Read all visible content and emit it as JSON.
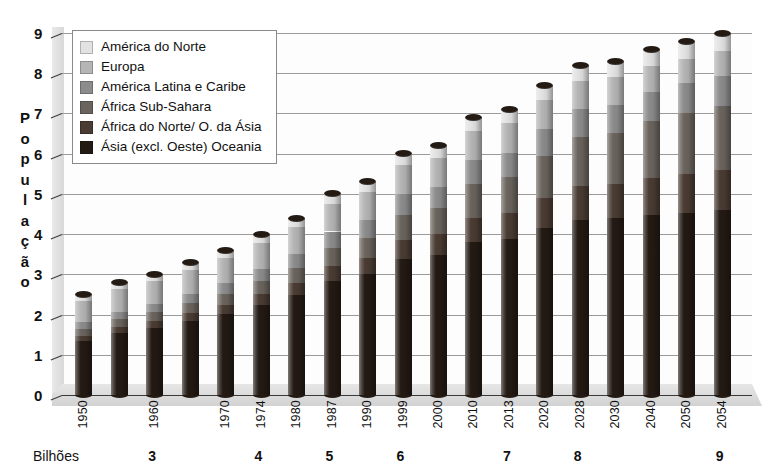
{
  "chart_data": {
    "type": "bar",
    "subtype": "stacked-3d-cylinder",
    "title": "",
    "xlabel": "",
    "ylabel": "População",
    "ylim": [
      0,
      9
    ],
    "yticks": [
      "0",
      "1",
      "2",
      "3",
      "4",
      "5",
      "6",
      "7",
      "8",
      "9"
    ],
    "grid": true,
    "legend_position": "top-left",
    "units_note": "Bilhões",
    "categories": [
      "1950",
      "",
      "1960",
      "",
      "1970",
      "1974",
      "1980",
      "1987",
      "1990",
      "1999",
      "2000",
      "2010",
      "2013",
      "2020",
      "2028",
      "2030",
      "2040",
      "2050",
      "2054"
    ],
    "series": [
      {
        "name": "Ásia (excl. Oeste) Oceania",
        "color": "#241a14",
        "values": [
          1.4,
          1.62,
          1.8,
          1.95,
          2.15,
          2.35,
          2.6,
          2.95,
          3.1,
          3.45,
          3.55,
          3.85,
          3.95,
          4.25,
          4.55,
          4.62,
          4.82,
          4.98,
          5.02
        ]
      },
      {
        "name": "África do Norte/ O. da Ásia",
        "color": "#4a3c33",
        "values": [
          0.14,
          0.16,
          0.18,
          0.21,
          0.24,
          0.28,
          0.32,
          0.38,
          0.41,
          0.5,
          0.52,
          0.62,
          0.66,
          0.76,
          0.88,
          0.9,
          1.0,
          1.07,
          1.09
        ]
      },
      {
        "name": "África Sub-Sahara",
        "color": "#6b645e",
        "values": [
          0.18,
          0.2,
          0.23,
          0.26,
          0.29,
          0.33,
          0.39,
          0.47,
          0.51,
          0.64,
          0.67,
          0.84,
          0.9,
          1.07,
          1.28,
          1.32,
          1.52,
          1.7,
          1.74
        ]
      },
      {
        "name": "América Latina e Caribe",
        "color": "#8c8c8c",
        "values": [
          0.17,
          0.19,
          0.22,
          0.25,
          0.28,
          0.32,
          0.36,
          0.42,
          0.45,
          0.52,
          0.54,
          0.6,
          0.62,
          0.68,
          0.73,
          0.74,
          0.78,
          0.8,
          0.8
        ]
      },
      {
        "name": "Europa",
        "color": "#b5b5b5",
        "values": [
          0.55,
          0.58,
          0.61,
          0.63,
          0.66,
          0.68,
          0.69,
          0.71,
          0.72,
          0.73,
          0.73,
          0.74,
          0.74,
          0.73,
          0.72,
          0.72,
          0.7,
          0.68,
          0.68
        ]
      },
      {
        "name": "América do Norte",
        "color": "#e2e2e2",
        "values": [
          0.17,
          0.18,
          0.19,
          0.2,
          0.21,
          0.23,
          0.24,
          0.26,
          0.27,
          0.3,
          0.31,
          0.34,
          0.35,
          0.38,
          0.41,
          0.42,
          0.45,
          0.48,
          0.49
        ]
      }
    ],
    "totals": [
      2.61,
      2.93,
      3.23,
      3.5,
      3.83,
      4.19,
      4.6,
      5.19,
      5.46,
      6.14,
      6.32,
      6.99,
      7.22,
      7.87,
      8.57,
      8.72,
      9.27,
      9.71,
      9.82
    ],
    "bar_tops_displayed": [
      2.5,
      2.8,
      3.0,
      3.3,
      3.6,
      4.0,
      4.4,
      5.0,
      5.3,
      6.0,
      6.2,
      6.9,
      7.1,
      7.7,
      8.2,
      8.3,
      8.6,
      8.8,
      9.0
    ],
    "milestones": [
      {
        "label": "3",
        "category": "1960"
      },
      {
        "label": "4",
        "category": "1974"
      },
      {
        "label": "5",
        "category": "1987"
      },
      {
        "label": "6",
        "category": "1999"
      },
      {
        "label": "7",
        "category": "2013"
      },
      {
        "label": "8",
        "category": "2028"
      },
      {
        "label": "9",
        "category": "2054"
      }
    ]
  },
  "legend": {
    "items": [
      {
        "label": "América do Norte",
        "color": "#e2e2e2"
      },
      {
        "label": "Europa",
        "color": "#b5b5b5"
      },
      {
        "label": "América Latina e Caribe",
        "color": "#8c8c8c"
      },
      {
        "label": "África Sub-Sahara",
        "color": "#6b645e"
      },
      {
        "label": "África do Norte/ O. da Ásia",
        "color": "#4a3c33"
      },
      {
        "label": "Ásia (excl. Oeste) Oceania",
        "color": "#241a14"
      }
    ]
  },
  "axis": {
    "y_title_letters": [
      "P",
      "o",
      "p",
      "u",
      "l",
      "a",
      "ç",
      "ã",
      "o"
    ],
    "y_title": "População",
    "y_ticks": [
      "9",
      "8",
      "7",
      "6",
      "5",
      "4",
      "3",
      "2",
      "1",
      "0"
    ],
    "units_label": "Bilhões"
  }
}
